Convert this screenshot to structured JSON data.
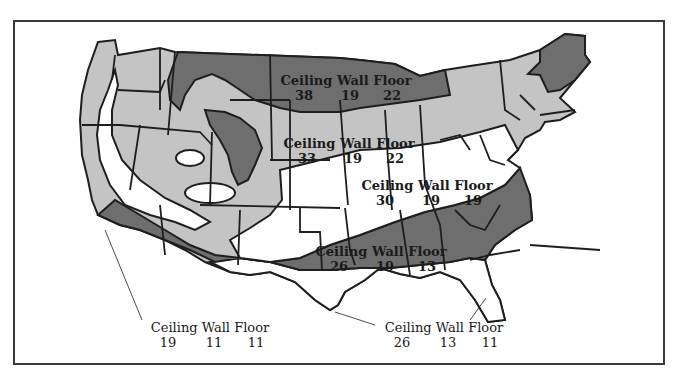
{
  "map": {
    "type": "insulation-zone-map",
    "region": "Continental United States",
    "shading": {
      "dark": "#6e6e6e",
      "medium": "#c4c4c4",
      "light": "#ffffff",
      "outline": "#1e1e1e"
    },
    "header_labels": {
      "ceiling": "Ceiling",
      "wall": "Wall",
      "floor": "Floor"
    },
    "zones": [
      {
        "id": "north-central",
        "shade": "dark",
        "ceiling": "38",
        "wall": "19",
        "floor": "22"
      },
      {
        "id": "upper-middle",
        "shade": "medium",
        "ceiling": "33",
        "wall": "19",
        "floor": "22"
      },
      {
        "id": "middle",
        "shade": "light",
        "ceiling": "30",
        "wall": "19",
        "floor": "19"
      },
      {
        "id": "south-central",
        "shade": "dark",
        "ceiling": "26",
        "wall": "19",
        "floor": "13"
      },
      {
        "id": "west-coast",
        "shade": "white",
        "ceiling": "19",
        "wall": "11",
        "floor": "11"
      },
      {
        "id": "gulf-south",
        "shade": "white",
        "ceiling": "26",
        "wall": "13",
        "floor": "11"
      }
    ]
  }
}
